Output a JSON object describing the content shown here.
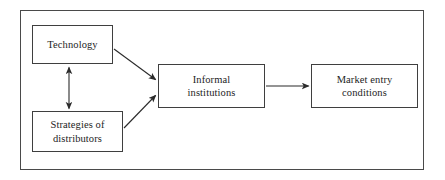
{
  "diagram": {
    "type": "flowchart",
    "background_color": "#ffffff",
    "frame": {
      "name": "outer-frame",
      "border_color": "#4a4a4a"
    },
    "node_style": {
      "fill": "#ffffff",
      "border_color": "#3f3f3f",
      "text_color": "#1d1d1d"
    },
    "nodes": [
      {
        "id": "technology",
        "label": "Technology"
      },
      {
        "id": "strategies",
        "label": "Strategies of\ndistributors"
      },
      {
        "id": "informal",
        "label": "Informal\ninstitutions"
      },
      {
        "id": "market",
        "label": "Market entry\nconditions"
      }
    ],
    "edges": [
      {
        "id": "technology-to-informal",
        "from": "Technology",
        "to": "Informal institutions",
        "style": "single-arrow",
        "direction": "diagonal-down-right"
      },
      {
        "id": "strategies-to-informal",
        "from": "Strategies of distributors",
        "to": "Informal institutions",
        "style": "single-arrow",
        "direction": "diagonal-up-right"
      },
      {
        "id": "technology-strategies",
        "from": "Technology",
        "to": "Strategies of distributors",
        "style": "double-arrow",
        "direction": "vertical-bidirectional"
      },
      {
        "id": "informal-to-market",
        "from": "Informal institutions",
        "to": "Market entry conditions",
        "style": "single-arrow",
        "direction": "horizontal-right"
      }
    ]
  }
}
